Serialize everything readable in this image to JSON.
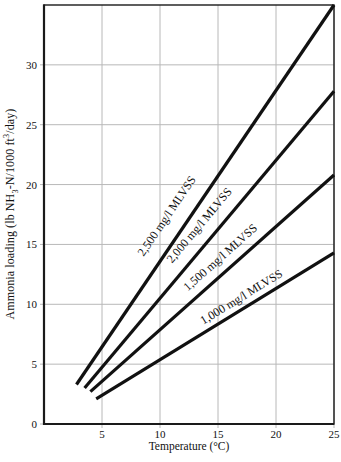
{
  "chart_data": {
    "type": "line",
    "title": "",
    "xlabel": "Temperature (°C)",
    "ylabel": "Ammonia loading (lb NH3-N/1000 ft3/day)",
    "ylabel_parts": {
      "pre": "Ammonia loading (lb NH",
      "sub": "3",
      "mid": "-N/1000 ft",
      "sup": "3",
      "post": "/day)"
    },
    "xlim": [
      0,
      25
    ],
    "ylim": [
      0,
      35
    ],
    "xticks": [
      5,
      10,
      15,
      20,
      25
    ],
    "yticks": [
      0,
      5,
      10,
      15,
      20,
      25,
      30
    ],
    "grid": true,
    "legend_position": "labels-along-lines",
    "axis_color": "#1a1a1a",
    "grid_color": "#b8b8b8",
    "line_color": "#111111",
    "series": [
      {
        "name": "2,500 mg/l MLVSS",
        "x": [
          2.8,
          25
        ],
        "y": [
          3.3,
          35.0
        ],
        "label_t": 12,
        "label_gap": 20
      },
      {
        "name": "2,000 mg/l MLVSS",
        "x": [
          3.5,
          25
        ],
        "y": [
          3.0,
          27.8
        ],
        "label_t": 14.5,
        "label_gap": 17
      },
      {
        "name": "1,500 mg/l MLVSS",
        "x": [
          4.0,
          25
        ],
        "y": [
          2.7,
          20.8
        ],
        "label_t": 16,
        "label_gap": 14
      },
      {
        "name": "1,000 mg/l MLVSS",
        "x": [
          4.5,
          25
        ],
        "y": [
          2.1,
          14.3
        ],
        "label_t": 17.5,
        "label_gap": 11
      }
    ]
  }
}
